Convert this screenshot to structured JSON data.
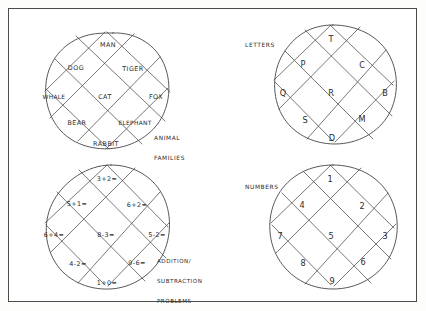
{
  "page": {
    "background_color": "#ffffff",
    "border_color": "#4a4a4a",
    "ink_color": "#3a3a3a"
  },
  "diagrams": [
    {
      "id": "animal-families",
      "caption": "ANIMAL\nFAMILIES",
      "caption_position": "bottom-right-outside",
      "cells": [
        {
          "text": "MAN",
          "col": 1,
          "row": 0
        },
        {
          "text": "DOG",
          "col": 0,
          "row": 1
        },
        {
          "text": "TIGER",
          "col": 2,
          "row": 1
        },
        {
          "text": "WHALE",
          "col": -1,
          "row": 2
        },
        {
          "text": "CAT",
          "col": 1,
          "row": 2
        },
        {
          "text": "FOX",
          "col": 3,
          "row": 2
        },
        {
          "text": "BEAR",
          "col": 0,
          "row": 3
        },
        {
          "text": "ELEPHANT",
          "col": 2,
          "row": 3
        },
        {
          "text": "RABBIT",
          "col": 1,
          "row": 4
        }
      ]
    },
    {
      "id": "letters",
      "caption": "LETTERS",
      "caption_position": "top-left-outside",
      "cells": [
        {
          "text": "T",
          "col": 1,
          "row": 0
        },
        {
          "text": "P",
          "col": 0,
          "row": 1
        },
        {
          "text": "C",
          "col": 2,
          "row": 1
        },
        {
          "text": "Q",
          "col": -1,
          "row": 2
        },
        {
          "text": "R",
          "col": 1,
          "row": 2
        },
        {
          "text": "B",
          "col": 3,
          "row": 2
        },
        {
          "text": "S",
          "col": 0,
          "row": 3
        },
        {
          "text": "M",
          "col": 2,
          "row": 3
        },
        {
          "text": "D",
          "col": 1,
          "row": 4
        }
      ]
    },
    {
      "id": "addition-subtraction-problems",
      "caption": "ADDITION/\nSUBTRACTION\nPROBLEMS",
      "caption_position": "bottom-right-outside",
      "cells": [
        {
          "text": "3+2=",
          "col": 1,
          "row": 0
        },
        {
          "text": "5+1=",
          "col": 0,
          "row": 1
        },
        {
          "text": "6+2=",
          "col": 2,
          "row": 1
        },
        {
          "text": "6+4=",
          "col": -1,
          "row": 2
        },
        {
          "text": "8-3=",
          "col": 1,
          "row": 2
        },
        {
          "text": "5-2=",
          "col": 3,
          "row": 2
        },
        {
          "text": "4-2=",
          "col": 0,
          "row": 3
        },
        {
          "text": "9-6=",
          "col": 2,
          "row": 3
        },
        {
          "text": "1+0=",
          "col": 1,
          "row": 4
        }
      ]
    },
    {
      "id": "numbers",
      "caption": "NUMBERS",
      "caption_position": "top-left-outside",
      "cells": [
        {
          "text": "1",
          "col": 1,
          "row": 0
        },
        {
          "text": "4",
          "col": 0,
          "row": 1
        },
        {
          "text": "2",
          "col": 2,
          "row": 1
        },
        {
          "text": "7",
          "col": -1,
          "row": 2
        },
        {
          "text": "5",
          "col": 1,
          "row": 2
        },
        {
          "text": "3",
          "col": 3,
          "row": 2
        },
        {
          "text": "8",
          "col": 0,
          "row": 3
        },
        {
          "text": "6",
          "col": 2,
          "row": 3
        },
        {
          "text": "9",
          "col": 1,
          "row": 4
        }
      ]
    }
  ],
  "captions": {
    "animal_families_line1": "ANIMAL",
    "animal_families_line2": "FAMILIES",
    "letters": "LETTERS",
    "addition_line1": "ADDITION/",
    "addition_line2": "SUBTRACTION",
    "addition_line3": "PROBLEMS",
    "numbers": "NUMBERS"
  }
}
